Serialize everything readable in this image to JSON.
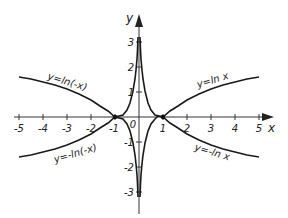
{
  "diagram": {
    "title": "",
    "axes": {
      "x_label": "x",
      "y_label": "y",
      "origin_label": "0",
      "x_ticks": [
        "-5",
        "-4",
        "-3",
        "-2",
        "-1",
        "1",
        "2",
        "3",
        "4",
        "5"
      ],
      "y_ticks": [
        "3",
        "2",
        "1",
        "-1",
        "-2",
        "-3"
      ]
    },
    "curves": [
      {
        "id": "ln_x",
        "label": "y=ln x"
      },
      {
        "id": "neg_ln_x",
        "label": "y=-ln x"
      },
      {
        "id": "ln_neg_x",
        "label": "y=ln(-x)"
      },
      {
        "id": "neg_ln_neg_x",
        "label": "y=-ln(-x)"
      }
    ],
    "intersection_points": [
      "(-1, 0)",
      "(1, 0)"
    ]
  },
  "colors": {
    "curve": "#1a1a1a",
    "axis": "#333333",
    "background": "#ffffff"
  }
}
